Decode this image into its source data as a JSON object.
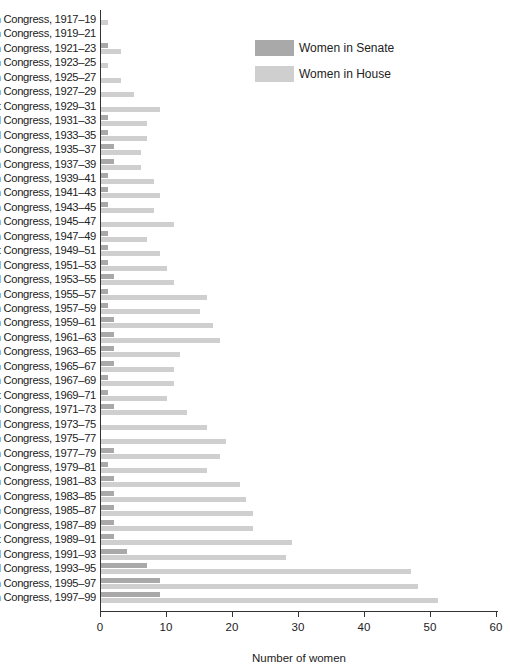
{
  "chart_data": {
    "type": "bar",
    "orientation": "horizontal",
    "title": "",
    "xlabel": "Number of women",
    "ylabel": "",
    "xlim": [
      0,
      60
    ],
    "x_ticks": [
      "0",
      "10",
      "20",
      "30",
      "40",
      "50",
      "60"
    ],
    "grid": false,
    "legend_position": "upper right",
    "categories": [
      "65th Congress, 1917–19",
      "66th Congress, 1919–21",
      "67th Congress, 1921–23",
      "68th Congress, 1923–25",
      "69th Congress, 1925–27",
      "70th Congress, 1927–29",
      "71st Congress, 1929–31",
      "72d Congress, 1931–33",
      "73d Congress, 1933–35",
      "74th Congress, 1935–37",
      "75th Congress, 1937–39",
      "76th Congress, 1939–41",
      "77th Congress, 1941–43",
      "78th Congress, 1943–45",
      "79th Congress, 1945–47",
      "80th Congress, 1947–49",
      "81st Congress, 1949–51",
      "82d Congress, 1951–53",
      "83d Congress, 1953–55",
      "84th Congress, 1955–57",
      "85th Congress, 1957–59",
      "86th Congress, 1959–61",
      "87th Congress, 1961–63",
      "88th Congress, 1963–65",
      "89th Congress, 1965–67",
      "90th Congress, 1967–69",
      "91st Congress, 1969–71",
      "92d Congress, 1971–73",
      "93d Congress, 1973–75",
      "94th Congress, 1975–77",
      "95th Congress, 1977–79",
      "96th Congress, 1979–81",
      "97th Congress, 1981–83",
      "98th Congress, 1983–85",
      "99th Congress, 1985–87",
      "100th Congress, 1987–89",
      "101st Congress, 1989–91",
      "102d Congress, 1991–93",
      "103d Congress, 1993–95",
      "104th Congress, 1995–97",
      "105th Congress, 1997–99"
    ],
    "series": [
      {
        "name": "Women in Senate",
        "color": "#a9a9a9",
        "values": [
          0,
          0,
          1,
          0,
          0,
          0,
          0,
          1,
          1,
          2,
          2,
          1,
          1,
          1,
          0,
          1,
          1,
          1,
          2,
          1,
          1,
          2,
          2,
          2,
          2,
          1,
          1,
          2,
          0,
          0,
          2,
          1,
          2,
          2,
          2,
          2,
          2,
          4,
          7,
          9,
          9
        ]
      },
      {
        "name": "Women in House",
        "color": "#cfcfcf",
        "values": [
          1,
          0,
          3,
          1,
          3,
          5,
          9,
          7,
          7,
          6,
          6,
          8,
          9,
          8,
          11,
          7,
          9,
          10,
          11,
          16,
          15,
          17,
          18,
          12,
          11,
          11,
          10,
          13,
          16,
          19,
          18,
          16,
          21,
          22,
          23,
          23,
          29,
          28,
          47,
          48,
          51
        ]
      }
    ]
  },
  "legend": {
    "items": [
      {
        "label": "Women in Senate",
        "color": "#a9a9a9"
      },
      {
        "label": "Women in House",
        "color": "#cfcfcf"
      }
    ]
  }
}
